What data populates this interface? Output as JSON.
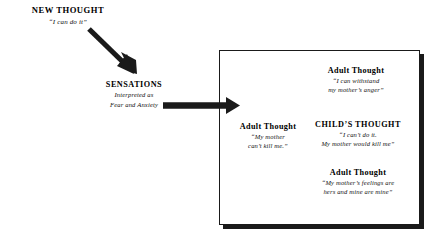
{
  "diagram": {
    "background_color": "#ffffff",
    "ink_color": "#1a1a1a"
  },
  "nodes": {
    "new_thought": {
      "label": "NEW THOUGHT",
      "quote": "“I can do it”"
    },
    "sensations": {
      "label": "SENSATIONS",
      "line1": "Interpreted as",
      "line2": "Fear and Anxiety"
    },
    "adult_withstand": {
      "label": "Adult Thought",
      "line1": "“I can withstand",
      "line2": "my mother’s anger”"
    },
    "adult_cantkill": {
      "label": "Adult Thought",
      "line1": "“My mother",
      "line2": "can’t kill me.”"
    },
    "childs_thought": {
      "label": "CHILD’S THOUGHT",
      "line1": "“I can’t do it.",
      "line2": "My mother would kill me”"
    },
    "adult_feelings": {
      "label": "Adult Thought",
      "line1": "“My mother’s feelings are",
      "line2": "hers and mine are mine”"
    }
  },
  "arrows": {
    "diagonal": {
      "name": "new-thought-to-sensations",
      "from": "NEW THOUGHT",
      "to": "SENSATIONS"
    },
    "horizontal": {
      "name": "sensations-to-thought-box",
      "from": "SENSATIONS",
      "to": "Thought box"
    }
  },
  "box": {
    "name": "thought-box"
  }
}
